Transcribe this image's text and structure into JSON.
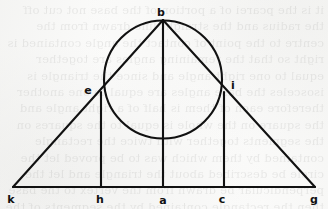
{
  "figure": {
    "background_color": "#fbfbfa",
    "ink_color": "#111111",
    "stroke_width": 2.1,
    "canvas": {
      "width": 328,
      "height": 209
    }
  },
  "points": [
    {
      "id": "b",
      "label": "b",
      "x": 163,
      "y": 20,
      "label_x": 161,
      "label_y": 12,
      "role": "apex"
    },
    {
      "id": "e",
      "label": "e",
      "x": 101,
      "y": 92,
      "label_x": 88,
      "label_y": 90,
      "role": "tangent-left"
    },
    {
      "id": "i",
      "label": "i",
      "x": 224,
      "y": 92,
      "label_x": 233,
      "label_y": 85,
      "role": "tangent-right"
    },
    {
      "id": "k",
      "label": "k",
      "x": 13,
      "y": 187,
      "label_x": 11,
      "label_y": 199,
      "role": "base-left"
    },
    {
      "id": "h",
      "label": "h",
      "x": 101,
      "y": 187,
      "label_x": 100,
      "label_y": 199,
      "role": "base-foot-left"
    },
    {
      "id": "a",
      "label": "a",
      "x": 163,
      "y": 187,
      "label_x": 163,
      "label_y": 200,
      "role": "base-midpoint"
    },
    {
      "id": "c",
      "label": "c",
      "x": 224,
      "y": 187,
      "label_x": 222,
      "label_y": 199,
      "role": "base-foot-right"
    },
    {
      "id": "g",
      "label": "g",
      "x": 315,
      "y": 187,
      "label_x": 314,
      "label_y": 199,
      "role": "base-right"
    }
  ],
  "segments": [
    {
      "id": "kb",
      "from": "k",
      "to": "b",
      "description": "left slant side through e"
    },
    {
      "id": "bg",
      "from": "b",
      "to": "g",
      "description": "right slant side through i"
    },
    {
      "id": "kg",
      "from": "k",
      "to": "g",
      "description": "base"
    },
    {
      "id": "ba",
      "from": "b",
      "to": "a",
      "description": "central vertical altitude"
    },
    {
      "id": "eh",
      "from": "e",
      "to": "h",
      "description": "left vertical"
    },
    {
      "id": "ic",
      "from": "i",
      "to": "c",
      "description": "right vertical"
    }
  ],
  "circle": {
    "center_x": 163,
    "center_y": 79.5,
    "radius": 59,
    "description": "circle through apex b, tangent points e and i"
  },
  "ghost_text": "it is the pcarei of a portion of the base not cut off the radius and the straight line drawn from the centre to the point of contact the angle contained is right so that the remaining angles are together equal to one right angle and since the triangle is isosceles the base angles are equal to one another therefore each of them is half of a right angle and the square on the whole is equal to the squares on the segments together with twice the rectangle contained by them which was to be proved let the circle be described about the triangle and let the perpendicular be drawn from the vertex to the base then the rectangle contained by the segments of the base is equal to the square on the perpendicular for the angle in a semicircle is right"
}
